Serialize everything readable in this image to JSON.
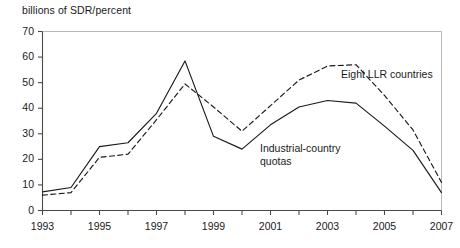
{
  "chart_data": {
    "type": "line",
    "title": "",
    "ylabel": "billions of SDR/percent",
    "xlabel": "",
    "ylim": [
      0,
      70
    ],
    "xlim": [
      1993,
      2007
    ],
    "ytick_labels": [
      "0",
      "10",
      "20",
      "30",
      "40",
      "50",
      "60",
      "70"
    ],
    "yticks": [
      0,
      10,
      20,
      30,
      40,
      50,
      60,
      70
    ],
    "xticks": [
      1993,
      1994,
      1995,
      1996,
      1997,
      1998,
      1999,
      2000,
      2001,
      2002,
      2003,
      2004,
      2005,
      2006,
      2007
    ],
    "xtick_labels": [
      "1993",
      "",
      "1995",
      "",
      "1997",
      "",
      "1999",
      "",
      "2001",
      "",
      "2003",
      "",
      "2005",
      "",
      "2007"
    ],
    "grid": false,
    "legend_position": "inline-annotation",
    "x": [
      1993,
      1994,
      1995,
      1996,
      1997,
      1998,
      1999,
      2000,
      2001,
      2002,
      2003,
      2004,
      2005,
      2006,
      2007
    ],
    "series": [
      {
        "name": "Industrial-country quotas",
        "style": "solid",
        "color": "#1a1a1a",
        "values": [
          7.3,
          9.0,
          25.0,
          26.5,
          38.0,
          58.5,
          29.0,
          24.0,
          33.5,
          40.5,
          43.0,
          42.0,
          33.0,
          23.5,
          7.0
        ]
      },
      {
        "name": "Eight LLR countries",
        "style": "dashed",
        "color": "#1a1a1a",
        "values": [
          6.0,
          7.0,
          20.8,
          22.0,
          35.5,
          49.5,
          40.5,
          31.0,
          41.0,
          51.0,
          56.5,
          57.0,
          45.0,
          31.5,
          11.0
        ]
      }
    ],
    "annotations": [
      {
        "id": "llr-label",
        "text": "Eight LLR countries",
        "x_px": 341,
        "y_px": 68
      },
      {
        "id": "quota-label",
        "text": "Industrial-country\nquotas",
        "x_px": 260,
        "y_px": 142
      }
    ]
  }
}
